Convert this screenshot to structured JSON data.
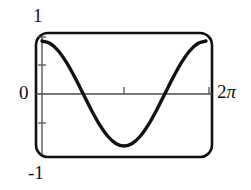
{
  "figure": {
    "name": "cosine-curve-plot",
    "background_color": "#ffffff",
    "frame_color": "#111111",
    "curve_color": "#111111",
    "axis_color": "#555555"
  },
  "labels": {
    "y_max": "1",
    "y_zero": "0",
    "y_min": "-1",
    "x_max_number": "2",
    "x_max_symbol": "π"
  },
  "chart_data": {
    "type": "line",
    "title": "",
    "xlabel": "",
    "ylabel": "",
    "xlim": [
      0,
      6.283185307179586
    ],
    "ylim": [
      -1,
      1
    ],
    "grid": false,
    "legend": null,
    "x_tick_labels": [
      "0",
      "2π"
    ],
    "y_tick_labels": [
      "1",
      "0",
      "-1"
    ],
    "y_minor_ticks": [
      1,
      0.5,
      -0.5
    ],
    "x_minor_ticks": [
      3.141592653589793,
      6.283185307179586
    ],
    "series": [
      {
        "name": "cos(x)",
        "x": [
          0,
          0.3141592653589793,
          0.6283185307179586,
          0.9424777960769379,
          1.2566370614359172,
          1.5707963267948966,
          1.8849555921538759,
          2.199114857512855,
          2.5132741228718345,
          2.827433388230814,
          3.141592653589793,
          3.455751918948772,
          3.7699111843077517,
          4.084070449666731,
          4.39822971502571,
          4.71238898038469,
          5.026548245743669,
          5.340707511102648,
          5.654866776461628,
          5.969026041820607,
          6.283185307179586
        ],
        "values": [
          0.93,
          0.885,
          0.753,
          0.547,
          0.287,
          0.0,
          -0.287,
          -0.547,
          -0.753,
          -0.885,
          -0.93,
          -0.885,
          -0.753,
          -0.547,
          -0.287,
          0.0,
          0.287,
          0.547,
          0.753,
          0.885,
          0.93
        ]
      }
    ]
  }
}
